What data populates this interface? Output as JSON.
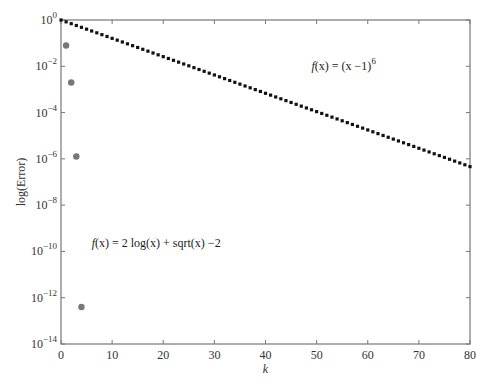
{
  "chart_data": {
    "type": "scatter",
    "title": "",
    "xlabel": "k",
    "ylabel": "log(Error)",
    "xlim": [
      0,
      80
    ],
    "ylim_log10": [
      -14,
      0
    ],
    "yscale": "log",
    "grid": false,
    "x_ticks": [
      0,
      10,
      20,
      30,
      40,
      50,
      60,
      70,
      80
    ],
    "y_ticks_exponents": [
      0,
      -2,
      -4,
      -6,
      -8,
      -10,
      -12,
      -14
    ],
    "y_tick_base": "10",
    "series": [
      {
        "name": "f(x) = (x-1)^6",
        "style": "dotted-markers",
        "color": "#111111",
        "x_range": [
          0,
          80
        ],
        "formula": "error_k = (5/6)^k",
        "log10_error_start": 0,
        "log10_error_end": -6.33
      },
      {
        "name": "f(x) = 2 log(x) + sqrt(x) - 2",
        "style": "markers",
        "color": "#777777",
        "points": [
          {
            "k": 1,
            "log10_error": -1.1
          },
          {
            "k": 2,
            "log10_error": -2.7
          },
          {
            "k": 3,
            "log10_error": -5.9
          },
          {
            "k": 4,
            "log10_error": -12.4
          }
        ]
      }
    ],
    "annotations": [
      {
        "text_func": "f",
        "text_arg": "(x) = (x −1)",
        "text_sup": "6",
        "at": {
          "k": 49,
          "log10": -2.0
        }
      },
      {
        "text_func": "f",
        "text_arg": "(x) = 2 log(x) + sqrt(x) −2",
        "at": {
          "k": 6,
          "log10": -10.0
        }
      }
    ]
  }
}
